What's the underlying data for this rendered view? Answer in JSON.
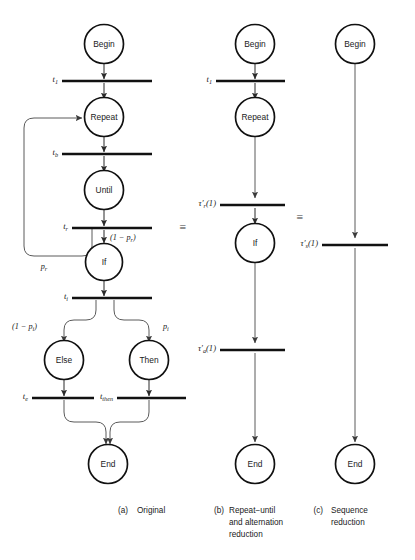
{
  "figure": {
    "columns": [
      {
        "id": "original",
        "caption_tag": "(a)",
        "caption_lines": [
          "Original"
        ],
        "places": [
          {
            "id": "a-begin",
            "label": "Begin"
          },
          {
            "id": "a-repeat",
            "label": "Repeat"
          },
          {
            "id": "a-until",
            "label": "Until"
          },
          {
            "id": "a-if",
            "label": "If"
          },
          {
            "id": "a-else",
            "label": "Else"
          },
          {
            "id": "a-then",
            "label": "Then"
          },
          {
            "id": "a-end",
            "label": "End"
          }
        ],
        "transitions": [
          {
            "id": "a-t1",
            "label": "t",
            "sub": "1"
          },
          {
            "id": "a-tb",
            "label": "t",
            "sub": "b"
          },
          {
            "id": "a-tr",
            "label": "t",
            "sub": "r"
          },
          {
            "id": "a-ti",
            "label": "t",
            "sub": "i"
          },
          {
            "id": "a-te",
            "label": "t",
            "sub": "e"
          },
          {
            "id": "a-tthen",
            "label": "t",
            "sub": "then"
          }
        ],
        "arc_labels": [
          {
            "id": "a-loop-prob",
            "text": "p",
            "sub": "r"
          },
          {
            "id": "a-exit-prob",
            "text": "(1 − p",
            "sub": "r",
            "tail": ")"
          },
          {
            "id": "a-else-prob",
            "text": "(1 − p",
            "sub": "i",
            "tail": ")"
          },
          {
            "id": "a-then-prob",
            "text": "p",
            "sub": "i"
          }
        ]
      },
      {
        "id": "repeat-until-alternation",
        "caption_tag": "(b)",
        "caption_lines": [
          "Repeat−until",
          "and alternation",
          "reduction"
        ],
        "places": [
          {
            "id": "b-begin",
            "label": "Begin"
          },
          {
            "id": "b-repeat",
            "label": "Repeat"
          },
          {
            "id": "b-if",
            "label": "If"
          },
          {
            "id": "b-end",
            "label": "End"
          }
        ],
        "transitions": [
          {
            "id": "b-t1",
            "label": "t",
            "sub": "1"
          },
          {
            "id": "b-taur",
            "label": "τ′",
            "sub": "r",
            "arg": "(1)"
          },
          {
            "id": "b-taua",
            "label": "τ′",
            "sub": "a",
            "arg": "(1)"
          }
        ]
      },
      {
        "id": "sequence",
        "caption_tag": "(c)",
        "caption_lines": [
          "Sequence",
          "reduction"
        ],
        "places": [
          {
            "id": "c-begin",
            "label": "Begin"
          },
          {
            "id": "c-end",
            "label": "End"
          }
        ],
        "transitions": [
          {
            "id": "c-taus",
            "label": "τ′",
            "sub": "s",
            "arg": "(1)"
          }
        ]
      }
    ],
    "equivalences": [
      {
        "id": "equiv-a-b",
        "symbol": "≡"
      },
      {
        "id": "equiv-b-c",
        "symbol": "≡"
      }
    ]
  }
}
